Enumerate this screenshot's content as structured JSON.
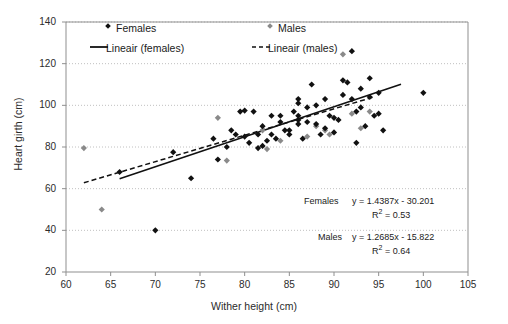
{
  "chart_data": {
    "type": "scatter",
    "title": "",
    "xlabel": "Wither height (cm)",
    "ylabel": "Heart girth (cm)",
    "xlim": [
      60,
      105
    ],
    "ylim": [
      20,
      140
    ],
    "xticks": [
      60,
      65,
      70,
      75,
      80,
      85,
      90,
      95,
      100,
      105
    ],
    "yticks": [
      20,
      40,
      60,
      80,
      100,
      120,
      140
    ],
    "grid": "horizontal-dotted",
    "legend_position": "inside-top",
    "legend": [
      "Females",
      "Males",
      "Lineair (females)",
      "Lineair (males)"
    ],
    "series": [
      {
        "name": "Females",
        "marker": "filled-diamond",
        "color": "#111111",
        "points": [
          [
            66,
            68
          ],
          [
            70,
            40
          ],
          [
            72,
            77.5
          ],
          [
            74,
            65
          ],
          [
            76.5,
            84
          ],
          [
            77,
            74
          ],
          [
            78,
            80
          ],
          [
            78.5,
            88
          ],
          [
            79,
            86
          ],
          [
            79.5,
            97
          ],
          [
            80,
            97.5
          ],
          [
            80,
            85
          ],
          [
            80.5,
            82
          ],
          [
            81,
            97
          ],
          [
            81.5,
            86
          ],
          [
            81.5,
            79.5
          ],
          [
            82,
            80.5
          ],
          [
            82,
            90
          ],
          [
            82.5,
            83
          ],
          [
            83,
            95
          ],
          [
            83,
            86
          ],
          [
            83.5,
            84
          ],
          [
            84,
            92
          ],
          [
            84,
            95
          ],
          [
            84.5,
            88
          ],
          [
            85,
            88
          ],
          [
            85,
            86
          ],
          [
            85.5,
            97
          ],
          [
            86,
            101
          ],
          [
            86,
            103
          ],
          [
            86,
            95
          ],
          [
            86,
            93
          ],
          [
            86,
            91
          ],
          [
            86.5,
            84
          ],
          [
            87,
            92
          ],
          [
            87,
            99
          ],
          [
            87.5,
            110
          ],
          [
            88,
            100
          ],
          [
            88,
            91
          ],
          [
            88.5,
            86
          ],
          [
            89,
            103
          ],
          [
            89,
            89
          ],
          [
            89.5,
            95
          ],
          [
            90,
            94
          ],
          [
            90,
            87
          ],
          [
            90.5,
            93
          ],
          [
            91,
            112
          ],
          [
            91,
            105
          ],
          [
            91.5,
            111
          ],
          [
            92,
            126
          ],
          [
            92,
            103
          ],
          [
            92.5,
            97
          ],
          [
            92.5,
            82
          ],
          [
            93,
            108
          ],
          [
            93,
            99
          ],
          [
            93.5,
            90
          ],
          [
            94,
            113
          ],
          [
            94,
            104
          ],
          [
            94.5,
            95
          ],
          [
            95,
            106
          ],
          [
            95,
            96
          ],
          [
            95.5,
            88
          ],
          [
            100,
            106
          ]
        ]
      },
      {
        "name": "Males",
        "marker": "filled-diamond-gray",
        "color": "#8a8a8a",
        "points": [
          [
            62,
            79.5
          ],
          [
            64,
            50
          ],
          [
            77,
            94
          ],
          [
            78,
            73.5
          ],
          [
            82,
            88
          ],
          [
            82.5,
            79
          ],
          [
            84,
            83
          ],
          [
            87,
            85
          ],
          [
            88,
            90
          ],
          [
            89,
            88
          ],
          [
            89.5,
            86
          ],
          [
            91,
            124.5
          ],
          [
            92,
            96
          ],
          [
            93,
            89
          ],
          [
            94,
            97
          ]
        ]
      }
    ],
    "trendlines": [
      {
        "name": "Lineair (females)",
        "style": "solid",
        "equation": "y = 1.4387x - 30.201",
        "slope": 1.4387,
        "intercept": -30.201,
        "r2": "0.53",
        "x_from": 66,
        "x_to": 97.5
      },
      {
        "name": "Lineair (males)",
        "style": "dashed",
        "equation": "y = 1.2685x - 15.822",
        "slope": 1.2685,
        "intercept": -15.822,
        "r2": "0.64",
        "x_from": 62,
        "x_to": 94.5
      }
    ],
    "annotations": [
      {
        "group_label": "Females",
        "equation": "y = 1.4387x - 30.201",
        "r2_label": "R",
        "r2_exp": "2",
        "r2_value": "= 0.53"
      },
      {
        "group_label": "Males",
        "equation": "y = 1.2685x - 15.822",
        "r2_label": "R",
        "r2_exp": "2",
        "r2_value": "= 0.64"
      }
    ]
  },
  "axis": {
    "x_title": "Wither height (cm)",
    "y_title": "Heart girth (cm)",
    "xticks": [
      "60",
      "65",
      "70",
      "75",
      "80",
      "85",
      "90",
      "95",
      "100",
      "105"
    ],
    "yticks": [
      "140",
      "120",
      "100",
      "80",
      "60",
      "40",
      "20"
    ]
  },
  "legend": {
    "females": "Females",
    "males": "Males",
    "linear_females": "Lineair (females)",
    "linear_males": "Lineair (males)"
  },
  "annotations": {
    "females_group": "Females",
    "females_eq": "y = 1.4387x - 30.201",
    "females_r2_prefix": "R",
    "females_r2_sup": "2",
    "females_r2_rest": " = 0.53",
    "males_group": "Males",
    "males_eq": "y = 1.2685x - 15.822",
    "males_r2_prefix": "R",
    "males_r2_sup": "2",
    "males_r2_rest": " = 0.64"
  },
  "colors": {
    "female_marker": "#111111",
    "male_marker": "#8a8a8a",
    "grid": "#b9b9b9",
    "axis": "#8f8f8f",
    "text": "#1a1a1a"
  }
}
